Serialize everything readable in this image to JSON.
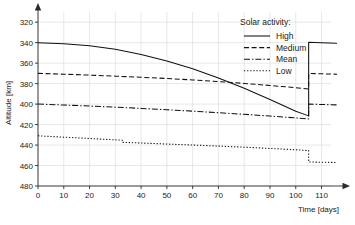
{
  "chart_data": {
    "type": "line",
    "title": "",
    "xlabel": "Time [days]",
    "ylabel": "Altitude [km]",
    "xlim": [
      0,
      116
    ],
    "ylim": [
      320,
      488
    ],
    "xticks": [
      0,
      10,
      20,
      30,
      40,
      50,
      60,
      70,
      80,
      90,
      100,
      110
    ],
    "yticks": [
      320,
      340,
      360,
      380,
      400,
      420,
      440,
      460,
      480
    ],
    "grid": true,
    "legend_position": "top-right",
    "legend_title": "Solar activity:",
    "series": [
      {
        "name": "High",
        "style": "solid",
        "x": [
          0,
          10,
          20,
          30,
          40,
          50,
          60,
          70,
          80,
          90,
          100,
          105,
          105,
          110,
          116
        ],
        "y": [
          460.0,
          459.0,
          457.0,
          453.5,
          448.5,
          442.0,
          434.5,
          425.5,
          415.5,
          404.5,
          393.0,
          388.5,
          460.5,
          460.0,
          459.4
        ]
      },
      {
        "name": "Medium",
        "style": "dashed",
        "x": [
          0,
          10,
          20,
          30,
          40,
          50,
          60,
          70,
          80,
          90,
          100,
          105,
          105,
          110,
          116
        ],
        "y": [
          430.0,
          429.2,
          428.3,
          427.3,
          426.2,
          425.0,
          423.6,
          422.0,
          420.2,
          418.2,
          416.0,
          414.8,
          430.0,
          429.6,
          429.2
        ]
      },
      {
        "name": "Mean",
        "style": "dashdot",
        "x": [
          0,
          10,
          20,
          30,
          40,
          50,
          60,
          70,
          80,
          90,
          100,
          105,
          105,
          110,
          116
        ],
        "y": [
          400.0,
          399.1,
          398.1,
          397.0,
          395.8,
          394.5,
          393.1,
          391.6,
          390.0,
          388.3,
          386.5,
          385.5,
          400.0,
          399.6,
          399.2
        ]
      },
      {
        "name": "Low",
        "style": "dotted",
        "x": [
          0,
          10,
          20,
          30,
          33,
          33,
          40,
          50,
          60,
          70,
          80,
          90,
          100,
          105,
          105,
          110,
          116
        ],
        "y": [
          369.0,
          367.7,
          366.4,
          365.1,
          364.7,
          362.6,
          362.0,
          361.0,
          360.0,
          359.0,
          357.9,
          356.7,
          355.4,
          354.6,
          343.5,
          343.2,
          343.0
        ]
      }
    ]
  },
  "axes": {
    "y_title": "Altitude [km]",
    "x_title": "Time [days]",
    "y_tick_labels": [
      "480",
      "460",
      "440",
      "420",
      "400",
      "380",
      "360",
      "340",
      "320"
    ],
    "x_tick_labels": [
      "0",
      "10",
      "20",
      "30",
      "40",
      "50",
      "60",
      "70",
      "80",
      "90",
      "100",
      "110"
    ]
  },
  "legend": {
    "title": "Solar activity:",
    "entries": [
      {
        "label": "High",
        "style": "solid"
      },
      {
        "label": "Medium",
        "style": "dashed"
      },
      {
        "label": "Mean",
        "style": "dashdot"
      },
      {
        "label": "Low",
        "style": "dotted"
      }
    ]
  },
  "colors": {
    "background": "#ffffff",
    "line": "#111111",
    "grid": "#d8d8d8",
    "axis": "#2a2a2a",
    "text": "#1a1a1a"
  }
}
